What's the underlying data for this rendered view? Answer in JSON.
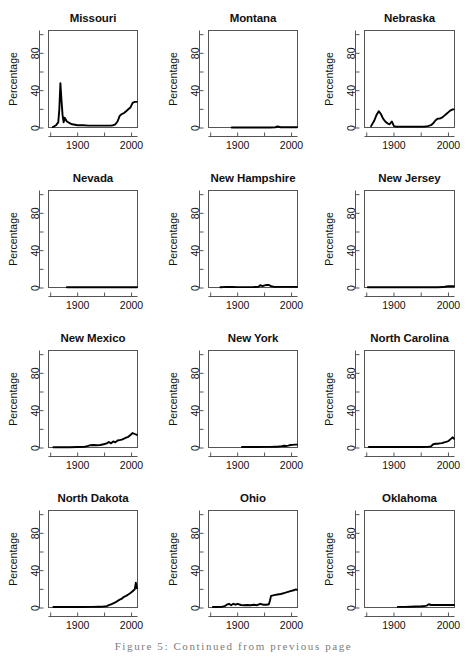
{
  "figure": {
    "caption": "Figure 5: Continued from previous page",
    "layout": {
      "rows": 4,
      "cols": 3,
      "panel_count": 12
    }
  },
  "axis": {
    "ylabel": "Percentage",
    "y_major_ticks": [
      0,
      40,
      80
    ],
    "y_minor_ticks": [
      20,
      60,
      100
    ],
    "y_tick_labels": [
      "0",
      "40",
      "80"
    ],
    "x_ticks": [
      1850,
      1900,
      1950,
      2000
    ],
    "x_tick_labels": [
      "",
      "1900",
      "",
      "2000"
    ],
    "xlim": [
      1845,
      2012
    ],
    "ylim": [
      0,
      105
    ],
    "line_color": "#000000",
    "axis_color": "#555555"
  },
  "chart_data": [
    {
      "type": "line",
      "title": "Missouri",
      "xlabel": "",
      "ylabel": "Percentage",
      "xlim": [
        1845,
        2012
      ],
      "ylim": [
        0,
        105
      ],
      "grid": false,
      "x": [
        1854,
        1860,
        1864,
        1866,
        1868,
        1870,
        1872,
        1874,
        1876,
        1880,
        1886,
        1890,
        1900,
        1910,
        1920,
        1930,
        1940,
        1950,
        1958,
        1962,
        1966,
        1970,
        1974,
        1978,
        1982,
        1986,
        1990,
        1994,
        1998,
        2002,
        2006,
        2010
      ],
      "values": [
        1,
        3,
        6,
        20,
        48,
        30,
        14,
        6,
        11,
        7,
        5,
        4,
        3,
        3,
        2.5,
        2.5,
        2.5,
        2.5,
        2.5,
        2.5,
        3,
        4,
        7,
        13,
        15,
        16,
        18,
        20,
        22,
        27,
        28,
        28
      ]
    },
    {
      "type": "line",
      "title": "Montana",
      "xlabel": "",
      "ylabel": "Percentage",
      "xlim": [
        1845,
        2012
      ],
      "ylim": [
        0,
        105
      ],
      "grid": false,
      "x": [
        1889,
        1900,
        1910,
        1920,
        1930,
        1940,
        1950,
        1960,
        1970,
        1974,
        1980,
        1990,
        2000,
        2010
      ],
      "values": [
        0.5,
        0.6,
        0.6,
        0.6,
        0.6,
        0.6,
        0.6,
        0.6,
        0.8,
        1.6,
        0.8,
        0.8,
        0.8,
        0.8
      ]
    },
    {
      "type": "line",
      "title": "Nebraska",
      "xlabel": "",
      "ylabel": "Percentage",
      "xlim": [
        1845,
        2012
      ],
      "ylim": [
        0,
        105
      ],
      "grid": false,
      "x": [
        1858,
        1864,
        1868,
        1872,
        1876,
        1880,
        1884,
        1888,
        1892,
        1896,
        1900,
        1904,
        1910,
        1920,
        1930,
        1940,
        1950,
        1956,
        1962,
        1968,
        1972,
        1976,
        1980,
        1984,
        1988,
        1992,
        1996,
        2000,
        2004,
        2008,
        2010
      ],
      "values": [
        2,
        8,
        14,
        18,
        15,
        10,
        7,
        5,
        4,
        7,
        2,
        1.5,
        1.5,
        1.5,
        1.5,
        1.5,
        1.5,
        1.5,
        2,
        3,
        5,
        8,
        10,
        10,
        11,
        13,
        15,
        17,
        19,
        20,
        20
      ]
    },
    {
      "type": "line",
      "title": "Nevada",
      "xlabel": "",
      "ylabel": "Percentage",
      "xlim": [
        1845,
        2012
      ],
      "ylim": [
        0,
        105
      ],
      "grid": false,
      "x": [
        1880,
        1900,
        1920,
        1940,
        1960,
        1980,
        2000,
        2010
      ],
      "values": [
        0.8,
        0.8,
        0.8,
        0.8,
        0.8,
        0.8,
        0.8,
        0.8
      ]
    },
    {
      "type": "line",
      "title": "New Hampshire",
      "xlabel": "",
      "ylabel": "Percentage",
      "xlim": [
        1845,
        2012
      ],
      "ylim": [
        0,
        105
      ],
      "grid": false,
      "x": [
        1868,
        1880,
        1890,
        1900,
        1910,
        1920,
        1930,
        1938,
        1942,
        1946,
        1950,
        1954,
        1958,
        1962,
        1968,
        1980,
        1990,
        2000,
        2010
      ],
      "values": [
        0.8,
        1.2,
        1.0,
        0.9,
        0.9,
        0.9,
        1.0,
        1.2,
        3.0,
        2.0,
        2.8,
        3.2,
        3.2,
        2.0,
        1.2,
        1.2,
        1.2,
        1.2,
        1.2
      ]
    },
    {
      "type": "line",
      "title": "New Jersey",
      "xlabel": "",
      "ylabel": "Percentage",
      "xlim": [
        1845,
        2012
      ],
      "ylim": [
        0,
        105
      ],
      "grid": false,
      "x": [
        1852,
        1870,
        1890,
        1910,
        1930,
        1950,
        1970,
        1980,
        1990,
        1996,
        2000,
        2006,
        2010
      ],
      "values": [
        0.8,
        0.8,
        0.8,
        0.8,
        0.8,
        0.8,
        0.8,
        0.8,
        1.0,
        1.6,
        1.8,
        1.8,
        1.8
      ]
    },
    {
      "type": "line",
      "title": "New Mexico",
      "xlabel": "",
      "ylabel": "Percentage",
      "xlim": [
        1845,
        2012
      ],
      "ylim": [
        0,
        105
      ],
      "grid": false,
      "x": [
        1855,
        1870,
        1885,
        1900,
        1912,
        1918,
        1924,
        1930,
        1936,
        1942,
        1948,
        1954,
        1958,
        1962,
        1966,
        1970,
        1974,
        1978,
        1982,
        1986,
        1990,
        1994,
        1998,
        2002,
        2006,
        2010
      ],
      "values": [
        0.8,
        0.8,
        0.8,
        1.0,
        1.2,
        2.0,
        3.0,
        3.2,
        3.0,
        3.2,
        4.0,
        5.0,
        6.5,
        5.0,
        7.0,
        6.0,
        8.0,
        8.5,
        9.0,
        10.0,
        11.0,
        12.0,
        14.0,
        16.0,
        15.0,
        14.0
      ]
    },
    {
      "type": "line",
      "title": "New York",
      "xlabel": "",
      "ylabel": "Percentage",
      "xlim": [
        1845,
        2012
      ],
      "ylim": [
        0,
        105
      ],
      "grid": false,
      "x": [
        1908,
        1920,
        1930,
        1940,
        1950,
        1960,
        1970,
        1976,
        1982,
        1986,
        1990,
        1994,
        1998,
        2002,
        2006,
        2010
      ],
      "values": [
        1.0,
        1.0,
        1.0,
        1.0,
        1.2,
        1.2,
        1.4,
        1.6,
        2.0,
        2.4,
        2.2,
        2.6,
        3.2,
        3.4,
        3.6,
        3.6
      ]
    },
    {
      "type": "line",
      "title": "North Carolina",
      "xlabel": "",
      "ylabel": "Percentage",
      "xlim": [
        1845,
        2012
      ],
      "ylim": [
        0,
        105
      ],
      "grid": false,
      "x": [
        1854,
        1870,
        1890,
        1910,
        1930,
        1950,
        1962,
        1968,
        1972,
        1976,
        1980,
        1984,
        1988,
        1992,
        1996,
        2000,
        2004,
        2008,
        2010
      ],
      "values": [
        1.0,
        1.0,
        1.0,
        1.0,
        1.0,
        1.0,
        1.2,
        1.8,
        4.0,
        4.5,
        4.6,
        5.0,
        5.2,
        6.0,
        6.5,
        7.5,
        9.5,
        11.5,
        10.0
      ]
    },
    {
      "type": "line",
      "title": "North Dakota",
      "xlabel": "",
      "ylabel": "Percentage",
      "xlim": [
        1845,
        2012
      ],
      "ylim": [
        0,
        105
      ],
      "grid": false,
      "x": [
        1855,
        1875,
        1895,
        1910,
        1925,
        1940,
        1948,
        1954,
        1958,
        1962,
        1966,
        1970,
        1974,
        1978,
        1982,
        1986,
        1990,
        1994,
        1998,
        2002,
        2004,
        2006,
        2008,
        2010
      ],
      "values": [
        1.0,
        1.0,
        1.0,
        1.0,
        1.2,
        1.4,
        1.6,
        2.0,
        3.0,
        4.0,
        5.0,
        6.0,
        7.5,
        9.0,
        10.0,
        12.0,
        13.0,
        14.5,
        16.0,
        18.0,
        19.0,
        20.0,
        27.0,
        21.0
      ]
    },
    {
      "type": "line",
      "title": "Ohio",
      "xlabel": "",
      "ylabel": "Percentage",
      "xlim": [
        1845,
        2012
      ],
      "ylim": [
        0,
        105
      ],
      "grid": false,
      "x": [
        1854,
        1862,
        1870,
        1876,
        1880,
        1884,
        1888,
        1892,
        1896,
        1900,
        1906,
        1912,
        1918,
        1924,
        1930,
        1936,
        1942,
        1948,
        1954,
        1958,
        1960,
        1962,
        1966,
        1970,
        1974,
        1980,
        1986,
        1992,
        1998,
        2004,
        2008,
        2010
      ],
      "values": [
        1.0,
        1.0,
        1.2,
        2.0,
        3.5,
        4.5,
        3.0,
        4.5,
        3.5,
        4.5,
        3.2,
        3.0,
        3.2,
        3.0,
        3.5,
        3.0,
        4.5,
        3.5,
        3.5,
        4.0,
        8.0,
        13.0,
        13.5,
        14.0,
        14.5,
        15.0,
        16.0,
        17.0,
        18.0,
        19.0,
        20.0,
        19.5
      ]
    },
    {
      "type": "line",
      "title": "Oklahoma",
      "xlabel": "",
      "ylabel": "Percentage",
      "xlim": [
        1845,
        2012
      ],
      "ylim": [
        0,
        105
      ],
      "grid": false,
      "x": [
        1907,
        1920,
        1930,
        1940,
        1950,
        1956,
        1960,
        1964,
        1968,
        1972,
        1980,
        1990,
        2000,
        2010
      ],
      "values": [
        1.2,
        1.2,
        1.4,
        1.6,
        1.8,
        2.0,
        2.6,
        4.0,
        3.2,
        3.2,
        3.2,
        3.2,
        3.2,
        3.2
      ]
    }
  ]
}
